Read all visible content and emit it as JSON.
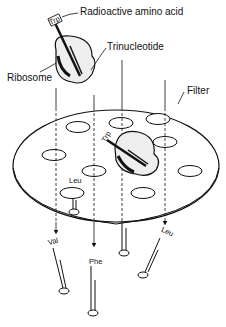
{
  "diagram": {
    "labels": {
      "radioactive_amino_acid": "Radioactive amino acid",
      "trinucleotide": "Trinucleotide",
      "ribosome": "Ribosome",
      "filter": "Filter"
    },
    "amino_acids": {
      "trp_top": "Trp",
      "trp_filter": "Trp",
      "leu_filter": "Leu",
      "val": "Val",
      "phe": "Phe",
      "leu_right": "Leu"
    },
    "codons": {
      "top": "UGG",
      "filter": "UGG"
    },
    "colors": {
      "ink": "#111111",
      "background": "#ffffff",
      "filter_fill": "#ffffff"
    }
  }
}
